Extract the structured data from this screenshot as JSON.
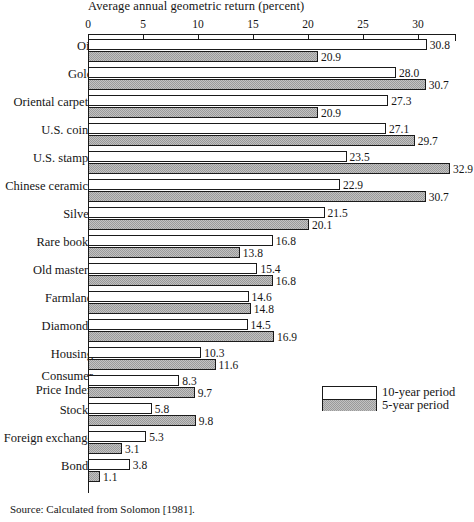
{
  "chart_data": {
    "type": "bar",
    "orientation": "horizontal",
    "title": "Average annual geometric return (percent)",
    "xlabel": "",
    "ylabel": "",
    "xlim": [
      0,
      33.4
    ],
    "xticks": [
      0,
      5,
      10,
      15,
      20,
      25,
      30
    ],
    "xticklabels": [
      "0",
      "5",
      "10",
      "15",
      "20",
      "25",
      "30"
    ],
    "grid": false,
    "legend_position": "middle-right",
    "categories": [
      "Oil",
      "Gold",
      "Oriental carpets",
      "U.S. coins",
      "U.S. stamps",
      "Chinese ceramics",
      "Silver",
      "Rare books",
      "Old masters",
      "Farmland",
      "Diamonds",
      "Housing",
      "Consumer Price Index",
      "Stocks",
      "Foreign exchange",
      "Bonds"
    ],
    "series": [
      {
        "name": "10-year period",
        "values": [
          30.8,
          28.0,
          27.3,
          27.1,
          23.5,
          22.9,
          21.5,
          16.8,
          15.4,
          14.6,
          14.5,
          10.3,
          8.3,
          5.8,
          5.3,
          3.8
        ],
        "labels": [
          "30.8",
          "28.0",
          "27.3",
          "27.1",
          "23.5",
          "22.9",
          "21.5",
          "16.8",
          "15.4",
          "14.6",
          "14.5",
          "10.3",
          "8.3",
          "5.8",
          "5.3",
          "3.8"
        ]
      },
      {
        "name": "5-year period",
        "values": [
          20.9,
          30.7,
          20.9,
          29.7,
          32.9,
          30.7,
          20.1,
          13.8,
          16.8,
          14.8,
          16.9,
          11.6,
          9.7,
          9.8,
          3.1,
          1.1
        ],
        "labels": [
          "20.9",
          "30.7",
          "20.9",
          "29.7",
          "32.9",
          "30.7",
          "20.1",
          "13.8",
          "16.8",
          "14.8",
          "16.9",
          "11.6",
          "9.7",
          "9.8",
          "3.1",
          "1.1"
        ]
      }
    ]
  },
  "legend": {
    "items": [
      {
        "label": "10-year period",
        "swatch": "white"
      },
      {
        "label": "5-year period",
        "swatch": "gray-hatch"
      }
    ]
  },
  "labels_split": [
    {
      "line1": "Oil",
      "line2": ""
    },
    {
      "line1": "Gold",
      "line2": ""
    },
    {
      "line1": "Oriental carpets",
      "line2": ""
    },
    {
      "line1": "U.S. coins",
      "line2": ""
    },
    {
      "line1": "U.S. stamps",
      "line2": ""
    },
    {
      "line1": "Chinese ceramics",
      "line2": ""
    },
    {
      "line1": "Silver",
      "line2": ""
    },
    {
      "line1": "Rare books",
      "line2": ""
    },
    {
      "line1": "Old masters",
      "line2": ""
    },
    {
      "line1": "Farmland",
      "line2": ""
    },
    {
      "line1": "Diamonds",
      "line2": ""
    },
    {
      "line1": "Housing",
      "line2": ""
    },
    {
      "line1": "Consumer",
      "line2": "Price Index"
    },
    {
      "line1": "Stocks",
      "line2": ""
    },
    {
      "line1": "Foreign exchange",
      "line2": ""
    },
    {
      "line1": "Bonds",
      "line2": ""
    }
  ],
  "source": {
    "text": "Source: Calculated from Solomon [1981]."
  },
  "colors": {
    "ink": "#1a1a1a",
    "background": "#ffffff",
    "bar_10yr": "#ffffff",
    "bar_5yr": "#c2c2c2"
  }
}
